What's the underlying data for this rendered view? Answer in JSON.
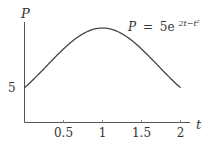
{
  "chart_data": {
    "type": "line",
    "title": "",
    "annotation": "P = 5e^{2t−t²}",
    "formula": {
      "lhs": "P",
      "eq": "=",
      "coef": "5e",
      "exponent": "2t−t²"
    },
    "xlabel": "t",
    "ylabel": "P",
    "x_ticks": [
      "0.5",
      "1",
      "1.5",
      "2"
    ],
    "y_ticks": [
      "5"
    ],
    "xlim": [
      0,
      2.2
    ],
    "ylim": [
      0,
      14.5
    ],
    "grid": false,
    "legend": "none",
    "series": [
      {
        "name": "P = 5e^(2t - t^2)",
        "x": [
          0,
          0.25,
          0.5,
          0.75,
          1,
          1.25,
          1.5,
          1.75,
          2
        ],
        "values": [
          5,
          7.72,
          10.59,
          12.76,
          13.59,
          12.76,
          10.59,
          7.72,
          5
        ]
      }
    ]
  }
}
